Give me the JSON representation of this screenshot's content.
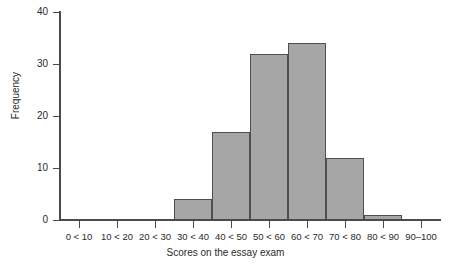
{
  "chart_data": {
    "type": "bar",
    "title": "",
    "subtitle": "",
    "xlabel": "Scores on the essay exam",
    "ylabel": "Frequency",
    "categories": [
      "0 < 10",
      "10 < 20",
      "20 < 30",
      "30 < 40",
      "40 < 50",
      "50 < 60",
      "60 < 70",
      "70 < 80",
      "80 < 90",
      "90–100"
    ],
    "values": [
      0,
      0,
      0,
      4,
      17,
      32,
      34,
      12,
      1,
      0
    ],
    "ylim": [
      0,
      40
    ],
    "xlim_bins": 10,
    "y_ticks": [
      0,
      10,
      20,
      30,
      40
    ],
    "y_tick_labels": [
      "0",
      "10",
      "20",
      "30",
      "40"
    ],
    "grid": false,
    "legend": "none",
    "colors": {
      "bar_fill": "#a6a6a6",
      "bar_edge": "#4f4f4f",
      "axis": "#4a4a4a",
      "text": "#2b2b2b",
      "background": "#ffffff"
    }
  }
}
